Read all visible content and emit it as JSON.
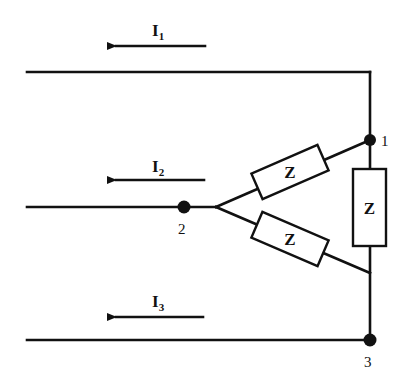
{
  "diagram": {
    "type": "delta-connected three-phase load",
    "currents": [
      {
        "id": "I1",
        "base": "I",
        "sub": "1",
        "direction": "left"
      },
      {
        "id": "I2",
        "base": "I",
        "sub": "2",
        "direction": "left"
      },
      {
        "id": "I3",
        "base": "I",
        "sub": "3",
        "direction": "left"
      }
    ],
    "nodes": [
      {
        "id": "node-1",
        "label": "1"
      },
      {
        "id": "node-2",
        "label": "2"
      },
      {
        "id": "node-3",
        "label": "3"
      }
    ],
    "impedances": [
      {
        "id": "z-12",
        "label": "Z",
        "between": "1-2"
      },
      {
        "id": "z-23",
        "label": "Z",
        "between": "2-3"
      },
      {
        "id": "z-13",
        "label": "Z",
        "between": "1-3"
      }
    ]
  }
}
